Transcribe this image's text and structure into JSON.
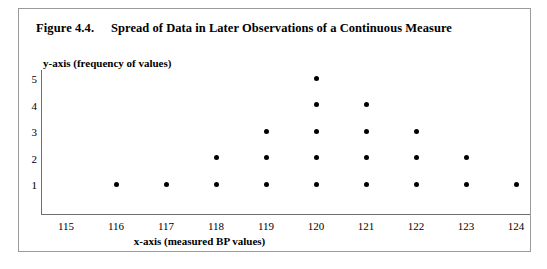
{
  "figure": {
    "number": "Figure 4.4.",
    "title": "Spread of Data in Later Observations of a Continuous Measure"
  },
  "chart_data": {
    "type": "scatter",
    "title": "Spread of Data in Later Observations of a Continuous Measure",
    "xlabel": "x-axis (measured BP values)",
    "ylabel": "y-axis (frequency of values)",
    "categories": [
      115,
      116,
      117,
      118,
      119,
      120,
      121,
      122,
      123,
      124
    ],
    "values": [
      0,
      1,
      1,
      2,
      3,
      5,
      4,
      3,
      2,
      1
    ],
    "x_tick_labels": [
      "115",
      "116",
      "117",
      "118",
      "119",
      "120",
      "121",
      "122",
      "123",
      "124"
    ],
    "y_tick_labels": [
      "1",
      "2",
      "3",
      "4",
      "5"
    ],
    "xlim": [
      114.5,
      124.5
    ],
    "ylim": [
      0,
      5.5
    ],
    "grid": false,
    "legend": false,
    "marker": "filled-circle",
    "marker_color": "#000000",
    "points": [
      {
        "x": 116,
        "y": 1
      },
      {
        "x": 117,
        "y": 1
      },
      {
        "x": 118,
        "y": 1
      },
      {
        "x": 118,
        "y": 2
      },
      {
        "x": 119,
        "y": 1
      },
      {
        "x": 119,
        "y": 2
      },
      {
        "x": 119,
        "y": 3
      },
      {
        "x": 120,
        "y": 1
      },
      {
        "x": 120,
        "y": 2
      },
      {
        "x": 120,
        "y": 3
      },
      {
        "x": 120,
        "y": 4
      },
      {
        "x": 120,
        "y": 5
      },
      {
        "x": 121,
        "y": 1
      },
      {
        "x": 121,
        "y": 2
      },
      {
        "x": 121,
        "y": 3
      },
      {
        "x": 121,
        "y": 4
      },
      {
        "x": 122,
        "y": 1
      },
      {
        "x": 122,
        "y": 2
      },
      {
        "x": 122,
        "y": 3
      },
      {
        "x": 123,
        "y": 1
      },
      {
        "x": 123,
        "y": 2
      },
      {
        "x": 124,
        "y": 1
      }
    ]
  }
}
